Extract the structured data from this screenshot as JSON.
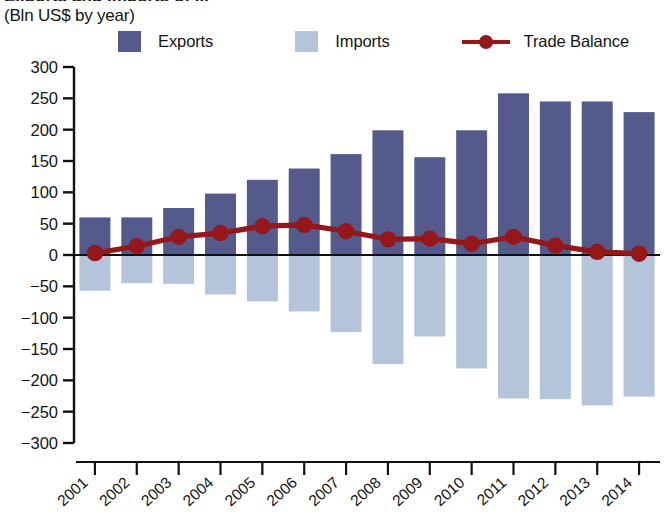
{
  "header": {
    "title_cropped": "Exports and imports of ...",
    "subtitle": "(Bln US$ by year)"
  },
  "legend": {
    "position": "top",
    "items": [
      {
        "label": "Exports",
        "color": "#545a8c",
        "marker": "square"
      },
      {
        "label": "Imports",
        "color": "#b4c4da",
        "marker": "square"
      },
      {
        "label": "Trade Balance",
        "color": "#96171a",
        "marker": "line-circle"
      }
    ]
  },
  "chart_data": {
    "type": "bar",
    "title": "Exports and imports of ...",
    "subtitle": "(Bln US$ by year)",
    "xlabel": "",
    "ylabel": "Bln US$",
    "ylim": [
      -300,
      300
    ],
    "ytick_step": 50,
    "yticks": [
      "300",
      "250",
      "200",
      "150",
      "100",
      "50",
      "0",
      "-50",
      "-100",
      "-150",
      "-200",
      "-250",
      "-300"
    ],
    "grid": false,
    "categories": [
      "2001",
      "2002",
      "2003",
      "2004",
      "2005",
      "2006",
      "2007",
      "2008",
      "2009",
      "2010",
      "2011",
      "2012",
      "2013",
      "2014"
    ],
    "series": [
      {
        "name": "Exports",
        "type": "bar",
        "color": "#545a8c",
        "values": [
          60,
          60,
          75,
          98,
          120,
          138,
          161,
          199,
          156,
          199,
          258,
          245,
          245,
          228
        ]
      },
      {
        "name": "Imports",
        "type": "bar",
        "color": "#b4c4da",
        "values": [
          -57,
          -45,
          -46,
          -63,
          -74,
          -90,
          -123,
          -174,
          -130,
          -181,
          -229,
          -230,
          -240,
          -226
        ]
      },
      {
        "name": "Trade Balance",
        "type": "line",
        "color": "#96171a",
        "values": [
          3,
          14,
          29,
          35,
          46,
          48,
          38,
          25,
          26,
          18,
          29,
          15,
          5,
          2
        ]
      }
    ]
  }
}
